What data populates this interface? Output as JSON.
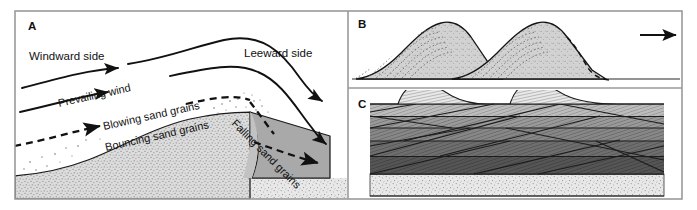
{
  "figure": {
    "panels": [
      {
        "id": "A",
        "label": "A",
        "caption": "Sand dune cross-section showing wind flow and sand grain transport",
        "annotations": [
          {
            "name": "windward-side-label",
            "text": "Windward side"
          },
          {
            "name": "leeward-side-label",
            "text": "Leeward side"
          },
          {
            "name": "prevailing-wind-label",
            "text": "Prevailing wind"
          },
          {
            "name": "blowing-sand-grains-label",
            "text": "Blowing sand grains"
          },
          {
            "name": "bouncing-sand-grains-label",
            "text": "Bouncing sand grains"
          },
          {
            "name": "falling-sand-grains-label",
            "text": "Falling sand grains"
          }
        ]
      },
      {
        "id": "B",
        "label": "B",
        "caption": "Migrating dunes with internal cross-bed laminations",
        "annotations": [
          {
            "name": "migration-direction-arrow",
            "text": ""
          }
        ]
      },
      {
        "id": "C",
        "label": "C",
        "caption": "Preserved cross-bedded strata beneath migrating dunes",
        "annotations": []
      }
    ],
    "labels": {
      "panel_a": "A",
      "panel_b": "B",
      "panel_c": "C",
      "windward": "Windward side",
      "leeward": "Leeward side",
      "prevailing_wind": "Prevailing wind",
      "blowing_sand": "Blowing sand grains",
      "bouncing_sand": "Bouncing sand grains",
      "falling_sand": "Falling sand grains"
    },
    "colors": {
      "background": "#ffffff",
      "frame_stroke": "#9a9a9a",
      "line": "#111111",
      "sand_light": "#d9d9d9",
      "sand_stipple": "#e6e6e6",
      "lee_wedge": "#a8a8a8",
      "dune_fill_b": "#cfcfcf",
      "strata_1": "#bcbcbc",
      "strata_2": "#9a9a9a",
      "strata_3": "#6e6e6e",
      "strata_4": "#8a8a8a",
      "strata_5": "#555555",
      "basal_layer": "#e2e2e2",
      "crest_fill_c": "#e4e4e4"
    }
  }
}
